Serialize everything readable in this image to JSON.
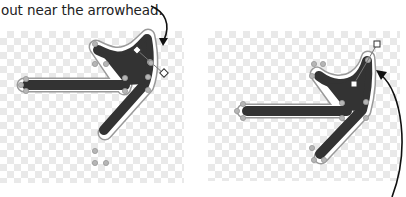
{
  "caption": {
    "text": "out near the arrowhead."
  },
  "figures": [
    {
      "name": "before",
      "description": "Arrow path with control handles extended near arrowhead",
      "handle_shape": "diamond"
    },
    {
      "name": "after",
      "description": "Arrow path with reshaped curve and square handles",
      "handle_shape": "square"
    }
  ],
  "colors": {
    "stroke_fill": "#333333",
    "path_outline": "#9a9a9a",
    "anchor_point": "#a8a8a8",
    "callout_arrow": "#111111",
    "checker": "#e9e9e9"
  }
}
